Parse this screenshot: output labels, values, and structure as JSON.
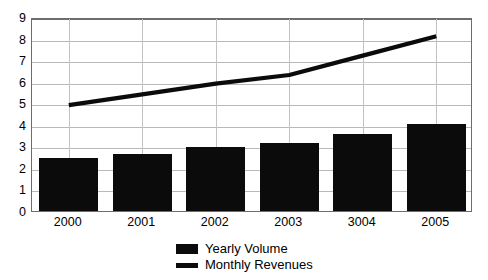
{
  "chart_data": {
    "type": "bar",
    "title": "",
    "subtitle": "",
    "xlabel": "",
    "ylabel": "",
    "categories": [
      "2000",
      "2001",
      "2002",
      "2003",
      "3004",
      "2005"
    ],
    "ylim": [
      0,
      9
    ],
    "yticks": [
      "0",
      "1",
      "2",
      "3",
      "4",
      "5",
      "6",
      "7",
      "8",
      "9"
    ],
    "grid": true,
    "legend_position": "bottom-center",
    "series": [
      {
        "name": "Yearly Volume",
        "type": "bar",
        "color": "#0b0b0b",
        "values": [
          2.45,
          2.65,
          2.95,
          3.15,
          3.55,
          4.05
        ]
      },
      {
        "name": "Monthly Revenues",
        "type": "line",
        "color": "#0b0b0b",
        "values": [
          5.0,
          5.5,
          6.0,
          6.4,
          7.3,
          8.2
        ]
      }
    ]
  },
  "legend": {
    "items": [
      {
        "label": "Yearly Volume",
        "marker": "filled-square-swatch"
      },
      {
        "label": "Monthly Revenues",
        "marker": "line-swatch"
      }
    ]
  },
  "colors": {
    "series": "#0b0b0b",
    "gridline": "#b9b9b9",
    "axis": "#6d6d6d",
    "background": "#ffffff"
  }
}
